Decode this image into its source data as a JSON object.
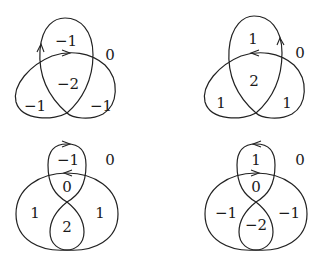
{
  "diagram": {
    "panels": [
      {
        "id": "top-left",
        "shape": "trefoil",
        "orientation": "clockwise",
        "labels": {
          "top": "−1",
          "outer": "0",
          "center": "−2",
          "left": "−1",
          "right": "−1"
        }
      },
      {
        "id": "top-right",
        "shape": "trefoil",
        "orientation": "counterclockwise",
        "labels": {
          "top": "1",
          "outer": "0",
          "center": "2",
          "left": "1",
          "right": "1"
        }
      },
      {
        "id": "bottom-left",
        "shape": "figure-eight-lobed",
        "labels": {
          "top": "−1",
          "outer": "0",
          "middle": "0",
          "left": "1",
          "right": "1",
          "bottom": "2"
        }
      },
      {
        "id": "bottom-right",
        "shape": "figure-eight-lobed",
        "labels": {
          "top": "1",
          "outer": "0",
          "middle": "0",
          "left": "−1",
          "right": "−1",
          "bottom": "−2"
        }
      }
    ]
  }
}
